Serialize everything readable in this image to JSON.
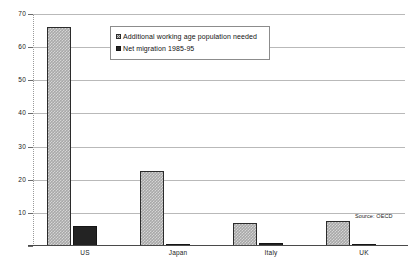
{
  "chart_data": {
    "type": "bar",
    "title": "",
    "xlabel": "",
    "ylabel": "",
    "ylim": [
      0,
      70
    ],
    "yticks": [
      0,
      10,
      20,
      30,
      40,
      50,
      60,
      70
    ],
    "grid": true,
    "legend_position": "top-center",
    "categories": [
      "US",
      "Japan",
      "Italy",
      "UK"
    ],
    "series": [
      {
        "name": "Additional working age population needed",
        "values": [
          66,
          22.5,
          7,
          7.5
        ]
      },
      {
        "name": "Net migration 1985-95",
        "values": [
          6,
          0.2,
          1,
          0.5
        ]
      }
    ],
    "source": "Source: OECD"
  },
  "legend": {
    "items": [
      {
        "label": "Additional working age population needed",
        "swatch": "hatched-gray-square"
      },
      {
        "label": "Net migration 1985-95",
        "swatch": "solid-black-square"
      }
    ]
  },
  "axis": {
    "y_tick_labels": [
      "0",
      "10",
      "20",
      "30",
      "40",
      "50",
      "60",
      "70"
    ],
    "x_tick_labels": [
      "US",
      "Japan",
      "Italy",
      "UK"
    ]
  },
  "footer": {
    "source": "Source: OECD"
  },
  "colors": {
    "series_a": "#a8a8a8",
    "series_b": "#232323",
    "gridline": "#b9b9b9",
    "axis": "#4a4a4a",
    "text": "#1a1a1a",
    "background": "#ffffff"
  }
}
